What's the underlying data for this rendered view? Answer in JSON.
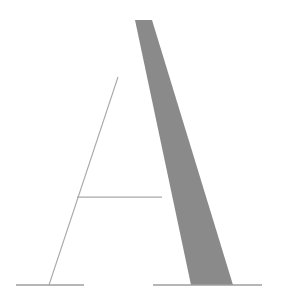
{
  "image": {
    "title": "Letter A",
    "description": "Serif capital letter A rendered as outline with a solid filled right diagonal stroke",
    "alt_text": "A",
    "character": "A",
    "width": 282,
    "height": 301,
    "background_color": "#ffffff"
  },
  "palette": {
    "background": "#ffffff",
    "stroke_fill": "#8a8a8a",
    "hairline": "#a8a8a8",
    "serif_line": "#9e9e9e"
  },
  "geometry": {
    "apex": {
      "x": 135,
      "y": 20
    },
    "baseline_y": 285,
    "crossbar_y": 197,
    "crossbar_left_x": 77,
    "crossbar_right_x": 162,
    "left_serif": {
      "x1": 16,
      "x2": 84,
      "y": 285
    },
    "right_serif": {
      "x1": 153,
      "x2": 262,
      "y": 285
    },
    "left_diagonal": {
      "x1": 118,
      "y1": 77,
      "x2": 49,
      "y2": 285
    },
    "thick_stroke_points": "135,20 152,20 233,285 191,285",
    "thick_stroke_top_x": 135,
    "thick_stroke_base_left_x": 191,
    "thick_stroke_base_right_x": 233,
    "hairline_width": 1.1,
    "serif_width": 1.4
  },
  "labels": {
    "figure_caption": "A"
  }
}
